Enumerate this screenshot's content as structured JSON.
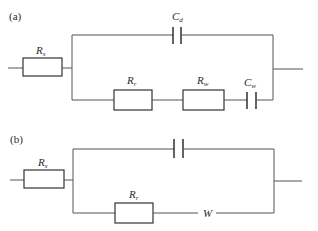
{
  "figure": {
    "colors": {
      "line": "#555555",
      "text": "#2a2a2a",
      "background": "#ffffff"
    }
  },
  "panel_a": {
    "label": "(a)",
    "components": {
      "rs": {
        "symbol": "R",
        "subscript": "s",
        "type": "resistor"
      },
      "cd": {
        "symbol": "C",
        "subscript": "d",
        "type": "capacitor"
      },
      "rr": {
        "symbol": "R",
        "subscript": "r",
        "type": "resistor"
      },
      "rw": {
        "symbol": "R",
        "subscript": "w",
        "type": "resistor"
      },
      "cw": {
        "symbol": "C",
        "subscript": "w",
        "type": "capacitor"
      }
    },
    "topology": "Rs in series with parallel( Cd , series(Rr, Rw, Cw) )"
  },
  "panel_b": {
    "label": "(b)",
    "components": {
      "rs": {
        "symbol": "R",
        "subscript": "s",
        "type": "resistor"
      },
      "c": {
        "symbol": "",
        "subscript": "",
        "type": "capacitor"
      },
      "rr": {
        "symbol": "R",
        "subscript": "r",
        "type": "resistor"
      },
      "w": {
        "symbol": "W",
        "subscript": "",
        "type": "warburg"
      }
    },
    "topology": "Rs in series with parallel( C , series(Rr, W) )"
  }
}
